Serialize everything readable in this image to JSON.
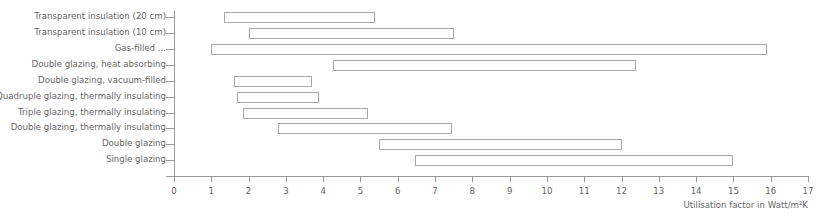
{
  "chart_data": {
    "type": "bar",
    "orientation": "horizontal-range",
    "title": "",
    "xlabel": "Utilisation factor in Watt/m²K",
    "ylabel": "",
    "xlim": [
      0,
      17
    ],
    "grid": false,
    "legend": null,
    "x_ticks": [
      "0",
      "1",
      "2",
      "3",
      "4",
      "5",
      "6",
      "7",
      "8",
      "9",
      "10",
      "11",
      "12",
      "13",
      "14",
      "15",
      "16",
      "17"
    ],
    "categories": [
      "Transparent insulation (20 cm)",
      "Transparent insulation (10 cm)",
      "Gas-filled ...",
      "Double glazing, heat absorbing",
      "Double glazing, vacuum-filled",
      "Quadruple glazing, thermally insulating",
      "Triple glazing, thermally insulating",
      "Double glazing, thermally insulating",
      "Double glazing",
      "Single glazing"
    ],
    "ranges": [
      {
        "label": "Transparent insulation (20 cm)",
        "min": 1.35,
        "max": 5.4
      },
      {
        "label": "Transparent insulation (10 cm)",
        "min": 2.0,
        "max": 7.5
      },
      {
        "label": "Gas-filled ...",
        "min": 1.0,
        "max": 15.9
      },
      {
        "label": "Double glazing, heat absorbing",
        "min": 4.25,
        "max": 12.4
      },
      {
        "label": "Double glazing, vacuum-filled",
        "min": 1.6,
        "max": 3.7
      },
      {
        "label": "Quadruple glazing, thermally insulating",
        "min": 1.7,
        "max": 3.9
      },
      {
        "label": "Triple glazing, thermally insulating",
        "min": 1.85,
        "max": 5.2
      },
      {
        "label": "Double glazing, thermally insulating",
        "min": 2.8,
        "max": 7.45
      },
      {
        "label": "Double glazing",
        "min": 5.5,
        "max": 12.0
      },
      {
        "label": "Single glazing",
        "min": 6.45,
        "max": 15.0
      }
    ],
    "colors": {
      "bar_border": "#a8a8a8",
      "bar_fill": "#ffffff",
      "axis": "#9a9a9a",
      "text": "#666666"
    }
  }
}
